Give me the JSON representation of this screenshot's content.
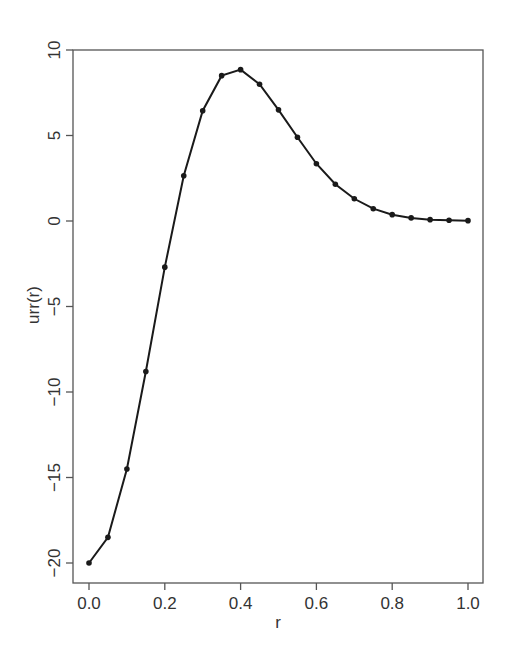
{
  "chart_data": {
    "type": "line",
    "title": "",
    "xlabel": "r",
    "ylabel": "urr(r)",
    "xlim": [
      0.0,
      1.0
    ],
    "ylim": [
      -20,
      10
    ],
    "x_ticks": [
      "0.0",
      "0.2",
      "0.4",
      "0.6",
      "0.8",
      "1.0"
    ],
    "y_ticks": [
      "-20",
      "-15",
      "-10",
      "-5",
      "0",
      "5",
      "10"
    ],
    "grid": false,
    "legend": null,
    "markers": true,
    "series": [
      {
        "name": "urr(r)",
        "x": [
          0.0,
          0.05,
          0.1,
          0.15,
          0.2,
          0.25,
          0.3,
          0.35,
          0.4,
          0.45,
          0.5,
          0.55,
          0.6,
          0.65,
          0.7,
          0.75,
          0.8,
          0.85,
          0.9,
          0.95,
          1.0
        ],
        "values": [
          -20.0,
          -18.5,
          -14.5,
          -8.8,
          -2.7,
          2.65,
          6.45,
          8.5,
          8.85,
          8.0,
          6.5,
          4.9,
          3.35,
          2.15,
          1.3,
          0.72,
          0.37,
          0.18,
          0.08,
          0.04,
          0.02
        ]
      }
    ]
  },
  "colors": {
    "line": "#1a1a1a",
    "axis": "#555555",
    "text": "#333333",
    "background": "#ffffff"
  }
}
